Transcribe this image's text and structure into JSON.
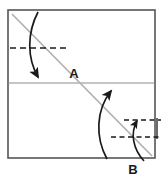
{
  "figure": {
    "type": "origami-fold-diagram",
    "background_color": "#ffffff",
    "sheet": {
      "name": "paper-sheet",
      "x": 8,
      "y": 10,
      "width": 147,
      "height": 148,
      "border_color": "#555555",
      "border_width": 1.6,
      "fill": "#ffffff"
    },
    "lines": {
      "horizontal_midline": {
        "label": "existing-horizontal-crease",
        "x1": 8,
        "y1": 83,
        "x2": 155,
        "y2": 83,
        "color": "#8c8c8c",
        "width": 1.2,
        "style": "solid"
      },
      "diagonal_crease": {
        "label": "existing-diagonal-crease",
        "x1": 12,
        "y1": 14,
        "x2": 152,
        "y2": 156,
        "color": "#b0b0b0",
        "width": 1.6,
        "style": "solid"
      },
      "dashed_top": {
        "label": "top-fold-target-line",
        "x1": 10,
        "y1": 48,
        "x2": 68,
        "y2": 48,
        "color": "#1a1a1a",
        "width": 1.4,
        "style": "dashed",
        "dash_pattern": "6,4"
      },
      "dashed_lower_upper": {
        "label": "lower-fold-target-line-upper",
        "x1": 124,
        "y1": 120,
        "x2": 161,
        "y2": 120,
        "color": "#1a1a1a",
        "width": 1.3,
        "style": "dashed",
        "dash_pattern": "5,3.5"
      },
      "dashed_lower_lower": {
        "label": "lower-fold-target-line-lower",
        "x1": 111,
        "y1": 137,
        "x2": 161,
        "y2": 137,
        "color": "#1a1a1a",
        "width": 1.3,
        "style": "dashed",
        "dash_pattern": "5,3.5"
      },
      "tick_right": {
        "label": "measurement-tick-right",
        "x1": 157,
        "y1": 118,
        "x2": 157,
        "y2": 139,
        "color": "#1a1a1a",
        "width": 1.3,
        "style": "solid"
      }
    },
    "arrows": {
      "top_fold_arrow": {
        "label": "fold-down-arrow-top",
        "direction": "down",
        "path": "M 38 12 C 28 32, 28 58, 38 78",
        "color": "#1a1a1a",
        "width": 1.7,
        "head_at": [
          38,
          78
        ],
        "head_angle_deg": 62
      },
      "bottom_large_arrow": {
        "label": "fold-up-arrow-bottom-large",
        "direction": "up",
        "path": "M 108 158 C 96 136, 96 110, 110 90",
        "color": "#1a1a1a",
        "width": 1.7,
        "head_at": [
          110,
          90
        ],
        "head_angle_deg": -55
      },
      "bottom_small_arrow": {
        "label": "fold-up-arrow-bottom-small",
        "direction": "up",
        "path": "M 143 160 C 133 148, 130 133, 136 120",
        "color": "#1a1a1a",
        "width": 1.6,
        "head_at": [
          136,
          120
        ],
        "head_angle_deg": -62
      }
    },
    "labels": [
      {
        "name": "label-a",
        "text": "A",
        "x": 74,
        "y": 78,
        "color": "#1a1a1a",
        "font_size": 13
      },
      {
        "name": "label-b",
        "text": "B",
        "x": 133,
        "y": 174,
        "color": "#1a1a1a",
        "font_size": 13
      }
    ]
  }
}
